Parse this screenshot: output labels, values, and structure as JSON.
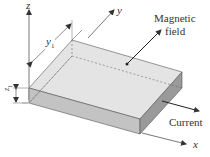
{
  "diagram": {
    "axes": {
      "z_label": "z",
      "y_label": "y",
      "x_label": "x"
    },
    "dimensions": {
      "y1_label": "y",
      "y1_subscript": "1",
      "z1_label": "z",
      "z1_subscript": "1"
    },
    "annotations": {
      "magnetic_field_line1": "Magnetic",
      "magnetic_field_line2": "field",
      "current": "Current"
    },
    "colors": {
      "top_face": "#e6e6e6",
      "front_face": "#c4c4c4",
      "side_face": "#9c9c9c",
      "lines": "#444444"
    }
  }
}
